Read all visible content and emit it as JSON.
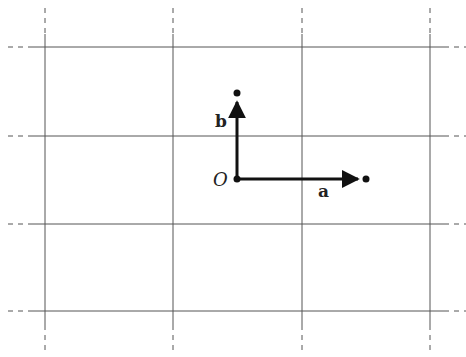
{
  "diagram": {
    "type": "lattice",
    "grid": {
      "x_lines": [
        45,
        173,
        302,
        430
      ],
      "y_lines": [
        47,
        136,
        224,
        311
      ],
      "line_color": "#555555"
    },
    "origin": {
      "label": "O",
      "x": 237,
      "y": 179
    },
    "vectors": [
      {
        "name": "a",
        "label": "a",
        "from": [
          237,
          179
        ],
        "to": [
          366,
          179
        ]
      },
      {
        "name": "b",
        "label": "b",
        "from": [
          237,
          179
        ],
        "to": [
          237,
          93
        ]
      }
    ]
  }
}
